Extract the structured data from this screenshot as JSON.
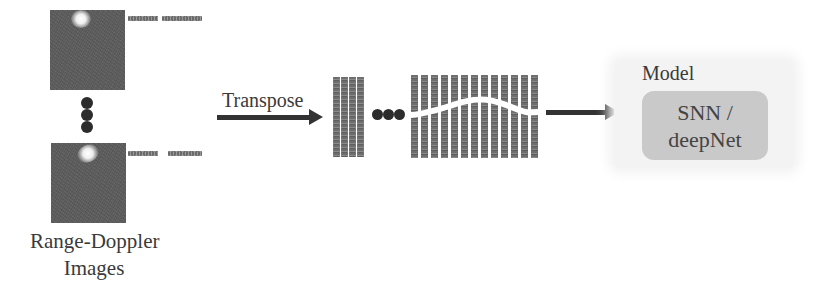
{
  "diagram": {
    "input": {
      "caption_line1": "Range-Doppler",
      "caption_line2": "Images",
      "image_count_shown": 2,
      "ellipsis": "vertical-dots"
    },
    "transform": {
      "label": "Transpose",
      "arrow": "right-arrow"
    },
    "spike_trains": {
      "first_group_columns": 4,
      "second_group_columns": 13,
      "ellipsis": "horizontal-dots"
    },
    "model": {
      "title": "Model",
      "line1": "SNN /",
      "line2": "deepNet"
    },
    "colors": {
      "image_fill": "#5e5e5e",
      "arrow": "#333333",
      "model_box": "#c9c9c9",
      "model_bg": "#f3f3f3",
      "text": "#3a3a3a"
    }
  }
}
